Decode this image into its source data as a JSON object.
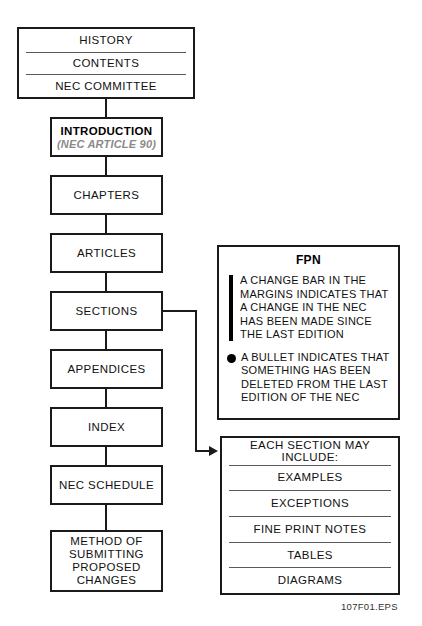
{
  "figure": {
    "eps_label": "107F01.EPS",
    "accent_color": "#000000",
    "box_border_color": "#1a1a1a",
    "subtitle_color": "#8a8a8a",
    "divider_color": "#5a5a5a"
  },
  "front_matter_box": {
    "name": "front-matter",
    "rows": [
      {
        "label": "HISTORY"
      },
      {
        "label": "CONTENTS"
      },
      {
        "label": "NEC COMMITTEE"
      }
    ]
  },
  "introduction_box": {
    "title": "INTRODUCTION",
    "subtitle": "(NEC ARTICLE 90)"
  },
  "flow_boxes": [
    {
      "key": "chapters",
      "label": "CHAPTERS"
    },
    {
      "key": "articles",
      "label": "ARTICLES"
    },
    {
      "key": "sections",
      "label": "SECTIONS"
    },
    {
      "key": "appendices",
      "label": "APPENDICES"
    },
    {
      "key": "index",
      "label": "INDEX"
    },
    {
      "key": "nec_schedule",
      "label": "NEC SCHEDULE"
    },
    {
      "key": "method",
      "label": "METHOD OF\nSUBMITTING\nPROPOSED\nCHANGES"
    }
  ],
  "fpn_box": {
    "title": "FPN",
    "items": [
      {
        "marker": "change-bar",
        "text": "A CHANGE BAR IN THE\nMARGINS INDICATES THAT\nA CHANGE IN THE NEC\nHAS BEEN MADE SINCE\nTHE LAST EDITION"
      },
      {
        "marker": "bullet",
        "text": "A BULLET INDICATES THAT\nSOMETHING HAS BEEN\nDELETED FROM THE LAST\nEDITION OF THE NEC"
      }
    ]
  },
  "section_includes_box": {
    "header": "EACH SECTION MAY INCLUDE:",
    "rows": [
      {
        "label": "EXAMPLES"
      },
      {
        "label": "EXCEPTIONS"
      },
      {
        "label": "FINE PRINT NOTES"
      },
      {
        "label": "TABLES"
      },
      {
        "label": "DIAGRAMS"
      }
    ]
  }
}
